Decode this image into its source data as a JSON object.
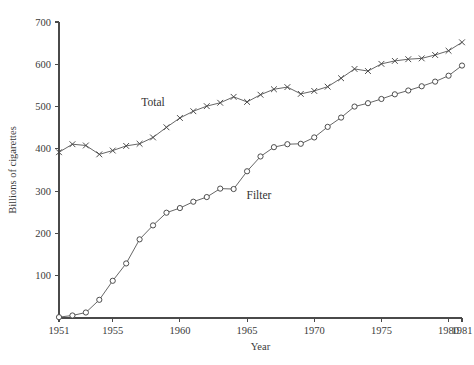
{
  "chart_data": {
    "type": "line",
    "title": "",
    "xlabel": "Year",
    "ylabel": "Billions of cigarettes",
    "xlim": [
      1951,
      1981
    ],
    "ylim": [
      0,
      700
    ],
    "grid": false,
    "legend_position": "inline-annotations",
    "x_ticks": [
      1951,
      1955,
      1960,
      1965,
      1970,
      1975,
      1980,
      1981
    ],
    "x_tick_labels": [
      "1951",
      "1955",
      "1960",
      "1965",
      "1970",
      "1975",
      "1980",
      "1981"
    ],
    "y_ticks": [
      100,
      200,
      300,
      400,
      500,
      600,
      700
    ],
    "y_tick_labels": [
      "100",
      "200",
      "300",
      "400",
      "500",
      "600",
      "700"
    ],
    "x": [
      1951,
      1952,
      1953,
      1954,
      1955,
      1956,
      1957,
      1958,
      1959,
      1960,
      1961,
      1962,
      1963,
      1964,
      1965,
      1966,
      1967,
      1968,
      1969,
      1970,
      1971,
      1972,
      1973,
      1974,
      1975,
      1976,
      1977,
      1978,
      1979,
      1980,
      1981
    ],
    "series": [
      {
        "name": "Total",
        "marker": "x",
        "label_text": "Total",
        "values": [
          392,
          411,
          408,
          387,
          396,
          407,
          412,
          427,
          451,
          473,
          489,
          501,
          509,
          523,
          511,
          528,
          541,
          546,
          530,
          537,
          547,
          567,
          589,
          584,
          601,
          608,
          612,
          614,
          622,
          632,
          652
        ]
      },
      {
        "name": "Filter",
        "marker": "o",
        "label_text": "Filter",
        "values": [
          2,
          6,
          13,
          43,
          88,
          129,
          186,
          219,
          249,
          260,
          275,
          286,
          306,
          305,
          347,
          382,
          404,
          411,
          412,
          427,
          452,
          474,
          500,
          508,
          518,
          529,
          538,
          548,
          559,
          573,
          597
        ]
      }
    ]
  },
  "footer_bleed": {
    "line1": "",
    "line2": ""
  }
}
